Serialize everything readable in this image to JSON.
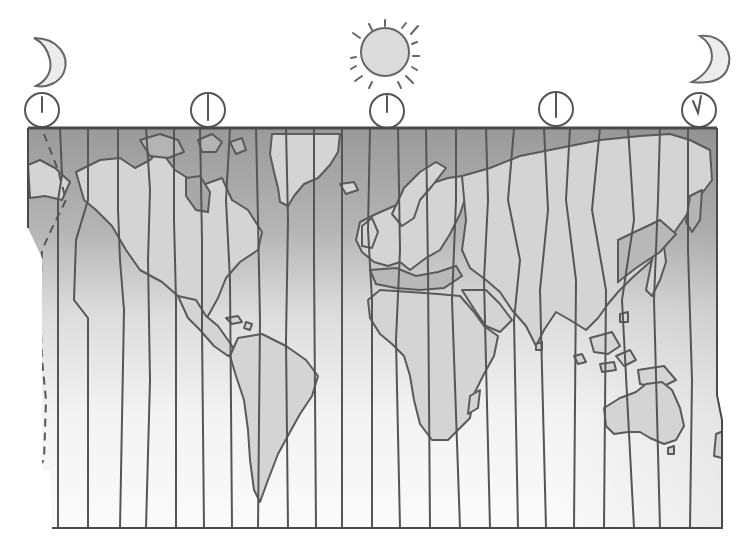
{
  "diagram": {
    "type": "time-zone map",
    "colors": {
      "ocean_top": "#9a9a9a",
      "ocean_bottom": "#fbfbfb",
      "land": "#d4d4d4",
      "land_shaded": "#b4b4b4",
      "lines": "#555555"
    },
    "sky_icons": [
      {
        "name": "moon-left",
        "icon": "crescent-moon-icon",
        "x": 45,
        "y": 60
      },
      {
        "name": "sun-center",
        "icon": "sun-icon",
        "x": 385,
        "y": 48
      },
      {
        "name": "moon-right",
        "icon": "crescent-moon-icon",
        "x": 705,
        "y": 60
      }
    ],
    "clocks": [
      {
        "name": "clock-1",
        "x": 42,
        "y": 110,
        "hand": "12 o'clock"
      },
      {
        "name": "clock-2",
        "x": 208,
        "y": 110,
        "hand": "12 o'clock"
      },
      {
        "name": "clock-3",
        "x": 387,
        "y": 111,
        "hand": "6 o'clock"
      },
      {
        "name": "clock-4",
        "x": 556,
        "y": 110,
        "hand": "12 o'clock"
      },
      {
        "name": "clock-5",
        "x": 700,
        "y": 110,
        "hand": "v-shaped"
      }
    ],
    "map": {
      "left": 28,
      "top": 128,
      "right": 720,
      "bottom": 528,
      "zone_count": 24,
      "international_date_line": "dashed, left edge",
      "continents": [
        "North America",
        "Greenland",
        "South America",
        "Europe",
        "Africa",
        "Asia",
        "Australia",
        "New Zealand",
        "Antarctic edge (none shown)"
      ]
    }
  }
}
